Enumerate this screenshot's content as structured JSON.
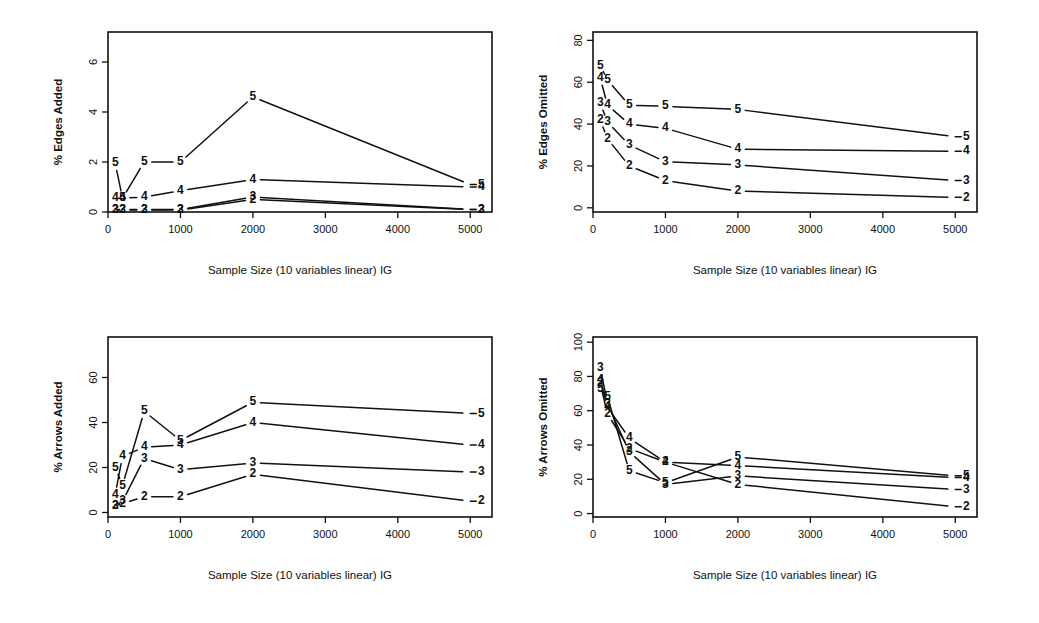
{
  "figure": {
    "background": "#ffffff",
    "ink_color": "#111111",
    "panel_count": 4
  },
  "chart_data": [
    {
      "id": "edges-added",
      "position": "top-left",
      "type": "line",
      "title": "",
      "xlabel": "Sample Size (10 variables linear) IG",
      "ylabel": "% Edges Added",
      "xlim": [
        0,
        5300
      ],
      "ylim": [
        0,
        7.2
      ],
      "xticks": [
        0,
        1000,
        2000,
        3000,
        4000,
        5000
      ],
      "xticklabels": [
        "0",
        "1000",
        "2000",
        "3000",
        "4000",
        "5000"
      ],
      "yticks": [
        0,
        2,
        4,
        6
      ],
      "yticklabels": [
        "0",
        "2",
        "4",
        "6"
      ],
      "grid": false,
      "legend": "point-labels",
      "x": [
        100,
        200,
        500,
        1000,
        2000,
        5000
      ],
      "series": [
        {
          "name": "5",
          "label": "5",
          "values": [
            1.95,
            0.55,
            2.0,
            2.0,
            4.6,
            1.1
          ]
        },
        {
          "name": "4",
          "label": "4",
          "values": [
            0.55,
            0.55,
            0.6,
            0.85,
            1.3,
            1.0
          ]
        },
        {
          "name": "3",
          "label": "3",
          "values": [
            0.1,
            0.1,
            0.1,
            0.1,
            0.6,
            0.1
          ]
        },
        {
          "name": "2",
          "label": "2",
          "values": [
            0.08,
            0.08,
            0.08,
            0.08,
            0.5,
            0.1
          ]
        }
      ]
    },
    {
      "id": "edges-omitted",
      "position": "top-right",
      "type": "line",
      "title": "",
      "xlabel": "Sample Size (10 variables linear) IG",
      "ylabel": "% Edges Omitted",
      "xlim": [
        0,
        5300
      ],
      "ylim": [
        -2,
        84
      ],
      "xticks": [
        0,
        1000,
        2000,
        3000,
        4000,
        5000
      ],
      "xticklabels": [
        "0",
        "1000",
        "2000",
        "3000",
        "4000",
        "5000"
      ],
      "yticks": [
        0,
        20,
        40,
        60,
        80
      ],
      "yticklabels": [
        "0",
        "20",
        "40",
        "60",
        "80"
      ],
      "grid": false,
      "legend": "point-labels",
      "x": [
        100,
        200,
        500,
        1000,
        2000,
        5000
      ],
      "series": [
        {
          "name": "5",
          "label": "5",
          "values": [
            68,
            61,
            49,
            48.5,
            47,
            34
          ]
        },
        {
          "name": "4",
          "label": "4",
          "values": [
            62,
            49,
            40,
            38,
            28,
            27
          ]
        },
        {
          "name": "3",
          "label": "3",
          "values": [
            50,
            41,
            30,
            22,
            20.5,
            13
          ]
        },
        {
          "name": "2",
          "label": "2",
          "values": [
            42,
            33,
            20,
            13,
            8,
            5
          ]
        }
      ]
    },
    {
      "id": "arrows-added",
      "position": "bottom-left",
      "type": "line",
      "title": "",
      "xlabel": "Sample Size (10 variables linear) IG",
      "ylabel": "% Arrows Added",
      "xlim": [
        0,
        5300
      ],
      "ylim": [
        -2,
        78
      ],
      "xticks": [
        0,
        1000,
        2000,
        3000,
        4000,
        5000
      ],
      "xticklabels": [
        "0",
        "1000",
        "2000",
        "3000",
        "4000",
        "5000"
      ],
      "yticks": [
        0,
        20,
        40,
        60
      ],
      "yticklabels": [
        "0",
        "20",
        "40",
        "60"
      ],
      "grid": false,
      "legend": "point-labels",
      "x": [
        100,
        200,
        500,
        1000,
        2000,
        5000
      ],
      "series": [
        {
          "name": "5",
          "label": "5",
          "values": [
            20,
            12,
            45,
            32,
            49,
            44
          ]
        },
        {
          "name": "4",
          "label": "4",
          "values": [
            8,
            25,
            29,
            30,
            40,
            30
          ]
        },
        {
          "name": "3",
          "label": "3",
          "values": [
            3,
            5,
            24,
            19,
            22,
            18
          ]
        },
        {
          "name": "2",
          "label": "2",
          "values": [
            3,
            4,
            7,
            7,
            17,
            5
          ]
        }
      ]
    },
    {
      "id": "arrows-omitted",
      "position": "bottom-right",
      "type": "line",
      "title": "",
      "xlabel": "Sample Size (10 variables linear) IG",
      "ylabel": "% Arrows Omitted",
      "xlim": [
        0,
        5300
      ],
      "ylim": [
        -2,
        103
      ],
      "xticks": [
        0,
        1000,
        2000,
        3000,
        4000,
        5000
      ],
      "xticklabels": [
        "0",
        "1000",
        "2000",
        "3000",
        "4000",
        "5000"
      ],
      "yticks": [
        0,
        20,
        40,
        60,
        80,
        100
      ],
      "yticklabels": [
        "0",
        "20",
        "40",
        "60",
        "80",
        "100"
      ],
      "grid": false,
      "legend": "point-labels",
      "x": [
        100,
        200,
        500,
        1000,
        2000,
        5000
      ],
      "series": [
        {
          "name": "5",
          "label": "5",
          "values": [
            73,
            68,
            25,
            18,
            33,
            22
          ]
        },
        {
          "name": "4",
          "label": "4",
          "values": [
            78,
            62,
            44,
            30,
            28,
            21
          ]
        },
        {
          "name": "3",
          "label": "3",
          "values": [
            85,
            64,
            36,
            17,
            22,
            14
          ]
        },
        {
          "name": "2",
          "label": "2",
          "values": [
            76,
            58,
            38,
            30,
            17,
            4
          ]
        }
      ]
    }
  ]
}
